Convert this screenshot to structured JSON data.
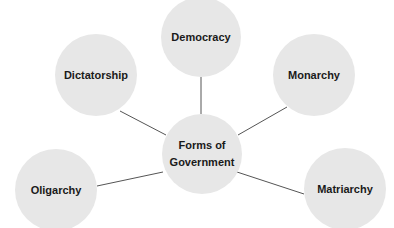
{
  "diagram": {
    "type": "mind-map",
    "center": {
      "label_line1": "Forms of",
      "label_line2": "Government",
      "cx": 202,
      "cy": 154,
      "r": 40
    },
    "nodes": [
      {
        "label": "Democracy",
        "cx": 201,
        "cy": 37,
        "r": 40
      },
      {
        "label": "Dictatorship",
        "cx": 96,
        "cy": 75,
        "r": 41
      },
      {
        "label": "Monarchy",
        "cx": 314,
        "cy": 75,
        "r": 41
      },
      {
        "label": "Oligarchy",
        "cx": 56,
        "cy": 190,
        "r": 41
      },
      {
        "label": "Matriarchy",
        "cx": 345,
        "cy": 189,
        "r": 41
      }
    ],
    "colors": {
      "node_fill": "#e7e7e7",
      "link": "#555555",
      "text": "#1a1a1a",
      "background": "#ffffff"
    }
  }
}
